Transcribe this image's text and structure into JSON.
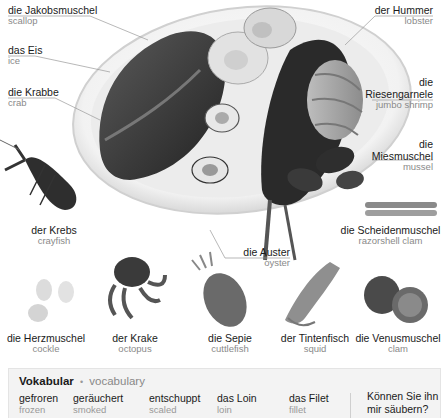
{
  "plate_labels": {
    "scallop": {
      "de": "die Jakobsmuschel",
      "en": "scallop"
    },
    "ice": {
      "de": "das Eis",
      "en": "ice"
    },
    "crab": {
      "de": "die Krabbe",
      "en": "crab"
    },
    "lobster": {
      "de": "der Hummer",
      "en": "lobster"
    },
    "jumbo_shrimp": {
      "de_line1": "die",
      "de_line2": "Riesengarnele",
      "en": "jumbo shrimp"
    },
    "mussel": {
      "de_line1": "die",
      "de_line2": "Miesmuschel",
      "en": "mussel"
    },
    "oyster": {
      "de": "die Auster",
      "en": "oyster"
    }
  },
  "standalone_items": {
    "crayfish": {
      "de": "der Krebs",
      "en": "crayfish"
    },
    "razorshell": {
      "de": "die Scheidenmuschel",
      "en": "razorshell clam"
    },
    "cockle": {
      "de": "die Herzmuschel",
      "en": "cockle"
    },
    "octopus": {
      "de": "der Krake",
      "en": "octopus"
    },
    "cuttlefish": {
      "de": "die Sepie",
      "en": "cuttlefish"
    },
    "squid": {
      "de": "der Tintenfisch",
      "en": "squid"
    },
    "clam": {
      "de": "die Venusmuschel",
      "en": "clam"
    }
  },
  "vocabulary": {
    "title": "Vokabular",
    "separator": "•",
    "subtitle": "vocabulary",
    "items": [
      {
        "de": "gefroren",
        "en": "frozen"
      },
      {
        "de": "geräuchert",
        "en": "smoked"
      },
      {
        "de": "entschuppt",
        "en": "scaled"
      },
      {
        "de": "das Loin",
        "en": "loin"
      },
      {
        "de": "das Filet",
        "en": "fillet"
      }
    ],
    "phrase": "Können Sie ihn mir säubern?"
  },
  "colors": {
    "german_text": "#1a1a1a",
    "english_text": "#8a8a8a",
    "leader_line": "#9a9a9a",
    "vocab_background": "#f3f3f3"
  }
}
